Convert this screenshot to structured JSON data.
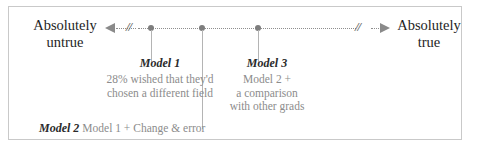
{
  "figure": {
    "type": "scale-diagram",
    "border_color": "#c9c9c9",
    "background": "#ffffff"
  },
  "scale": {
    "left_anchor": {
      "line1": "Absolutely",
      "line2": "untrue"
    },
    "right_anchor": {
      "line1": "Absolutely",
      "line2": "true"
    },
    "break_mark_left": "//",
    "break_mark_right": "//",
    "axis_color": "#8e8e8e",
    "marker_color": "#7d7d7d",
    "markers": [
      {
        "id": "marker-1",
        "x_px": 150
      },
      {
        "id": "marker-2",
        "x_px": 201
      },
      {
        "id": "marker-3",
        "x_px": 257
      }
    ]
  },
  "annotations": {
    "model1": {
      "name": "Model 1",
      "lines": [
        "28% wished that they'd",
        "chosen a different field"
      ]
    },
    "model3": {
      "name": "Model 3",
      "lines": [
        "Model 2 +",
        "a comparison",
        "with other grads"
      ]
    },
    "model2": {
      "name": "Model 2",
      "description": "Model 1 + Change & error"
    }
  }
}
